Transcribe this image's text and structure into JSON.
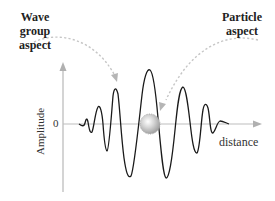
{
  "diagram": {
    "labels": {
      "wave_group": [
        "Wave group",
        "aspect"
      ],
      "particle": [
        "Particle",
        "aspect"
      ],
      "y_axis": "Amplitude",
      "x_axis": "distance",
      "zero": "0"
    },
    "colors": {
      "wave": "#1a1a1a",
      "axes": "#b8b8b8",
      "dashed_arrow": "#c8c8c8",
      "particle_fill": "#cfcfcf",
      "particle_edge": "#9a9a9a"
    }
  }
}
